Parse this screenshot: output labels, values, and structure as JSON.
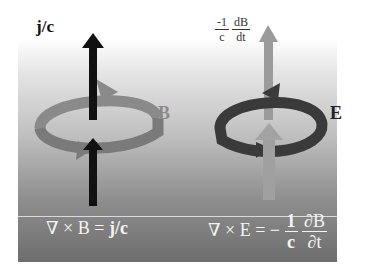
{
  "left": {
    "vector_label": "j/c",
    "loop_label": "B",
    "equation": {
      "lhs": "∇ × B = ",
      "rhs": "j/c"
    }
  },
  "right": {
    "vector_label": {
      "coef_num": "-1",
      "coef_den": "c",
      "deriv_num": "dB",
      "deriv_den": "dt"
    },
    "loop_label": "E",
    "equation": {
      "lhs": "∇ × E = −",
      "coef_num": "1",
      "coef_den": "c",
      "deriv_num": "∂B",
      "deriv_den": "∂t"
    }
  },
  "colors": {
    "current_arrow": "#111111",
    "b_loop": "#7f7f7f",
    "e_loop": "#3a3a3a",
    "dbdt_arrow": "#9a9a9a",
    "label_b": "#8a8a8a",
    "label_e": "#222222"
  }
}
